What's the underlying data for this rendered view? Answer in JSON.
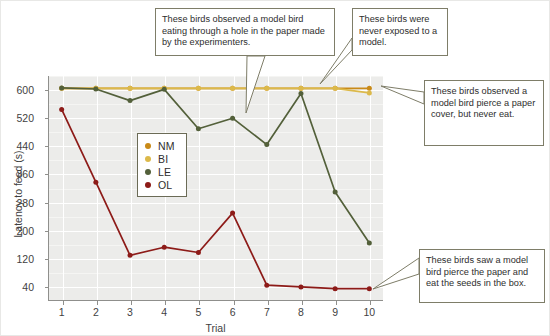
{
  "chart_data": {
    "type": "line",
    "title": "",
    "xlabel": "Trial",
    "ylabel": "Latency to feed (s)",
    "x": [
      1,
      2,
      3,
      4,
      5,
      6,
      7,
      8,
      9,
      10
    ],
    "xlim": [
      0.6,
      10.4
    ],
    "ylim": [
      0,
      640
    ],
    "yticks": [
      40,
      120,
      200,
      280,
      360,
      440,
      520,
      600
    ],
    "xticks": [
      "1",
      "2",
      "3",
      "4",
      "5",
      "6",
      "7",
      "8",
      "9",
      "10"
    ],
    "grid": true,
    "legend_position": "inside-left-center",
    "series": [
      {
        "name": "NM",
        "color": "#c98a18",
        "values": [
          605,
          605,
          605,
          605,
          605,
          605,
          605,
          605,
          605,
          605
        ]
      },
      {
        "name": "BI",
        "color": "#dcb94a",
        "values": [
          605,
          605,
          605,
          605,
          605,
          605,
          605,
          605,
          605,
          592
        ]
      },
      {
        "name": "LE",
        "color": "#53603a",
        "values": [
          606,
          603,
          570,
          602,
          490,
          520,
          445,
          590,
          310,
          165
        ]
      },
      {
        "name": "OL",
        "color": "#8d1b18",
        "values": [
          545,
          338,
          130,
          153,
          138,
          250,
          45,
          40,
          35,
          35
        ]
      }
    ],
    "annotations": [
      {
        "id": "cal1",
        "target_series": "LE",
        "target_x": 5,
        "text": "These birds observed a model bird eating through a hole in the paper made by the experimenters."
      },
      {
        "id": "cal2",
        "target_series": "NM",
        "target_x": 8,
        "text": "These birds were never exposed to a model."
      },
      {
        "id": "cal3",
        "target_series": "BI",
        "target_x": 10,
        "text": "These birds observed a model bird pierce a paper cover, but never eat."
      },
      {
        "id": "cal4",
        "target_series": "OL",
        "target_x": 9,
        "text": "These birds saw a model bird pierce the paper and eat the seeds in the box."
      }
    ]
  },
  "legend": {
    "items": [
      {
        "label": "NM",
        "color": "#c98a18"
      },
      {
        "label": "BI",
        "color": "#dcb94a"
      },
      {
        "label": "LE",
        "color": "#53603a"
      },
      {
        "label": "OL",
        "color": "#8d1b18"
      }
    ]
  },
  "axis": {
    "y_label": "Latency to feed (s)",
    "x_label": "Trial",
    "y_ticks": [
      "600",
      "520",
      "440",
      "360",
      "280",
      "200",
      "120",
      "40"
    ],
    "x_ticks": [
      "1",
      "2",
      "3",
      "4",
      "5",
      "6",
      "7",
      "8",
      "9",
      "10"
    ]
  },
  "callouts": {
    "cal1": "These birds observed a model bird eating through a hole in the paper made by the experimenters.",
    "cal2": "These birds were never exposed to a model.",
    "cal3": "These birds observed a model bird pierce a paper cover, but never eat.",
    "cal4": "These birds saw a model bird pierce the paper and eat the seeds in the box."
  },
  "colors": {
    "plot_background": "#ececea",
    "gridline": "#ffffff",
    "axis": "#8f8f8c",
    "callout_border": "#7e7d68",
    "legend_border": "#6b6b56"
  }
}
